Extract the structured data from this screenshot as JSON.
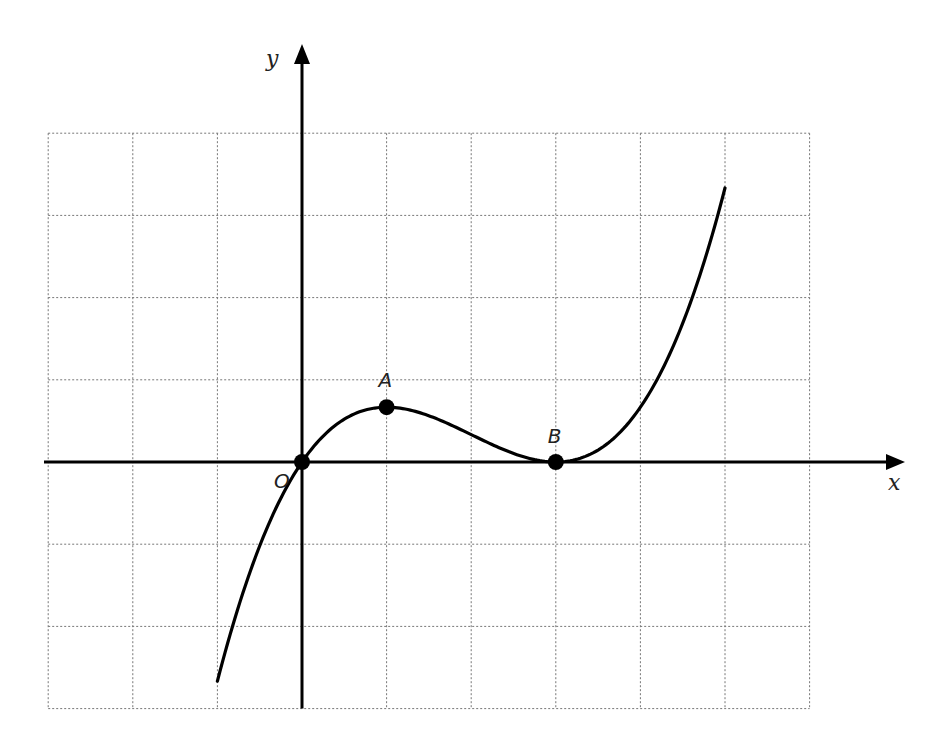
{
  "chart_data": {
    "type": "line",
    "title": "",
    "xlabel": "x",
    "ylabel": "y",
    "xlim": [
      -3,
      6
    ],
    "ylim": [
      -3,
      4
    ],
    "grid": true,
    "grid_step": 1,
    "function": "y = x(x-3)^2 / 6",
    "domain": [
      -1,
      5
    ],
    "series": [
      {
        "name": "curve",
        "x": [
          -1,
          -0.5,
          0,
          0.5,
          1,
          1.5,
          2,
          2.5,
          3,
          3.5,
          4,
          4.5,
          5
        ],
        "y": [
          -2.667,
          -1.021,
          0,
          0.521,
          0.667,
          0.563,
          0.333,
          0.104,
          0,
          0.146,
          0.667,
          1.688,
          3.333
        ]
      }
    ],
    "points": [
      {
        "label": "O",
        "x": 0,
        "y": 0
      },
      {
        "label": "A",
        "x": 1,
        "y": 0.667
      },
      {
        "label": "B",
        "x": 3,
        "y": 0
      }
    ]
  },
  "labels": {
    "x_axis": "x",
    "y_axis": "y",
    "origin": "O",
    "point_a": "A",
    "point_b": "B"
  }
}
